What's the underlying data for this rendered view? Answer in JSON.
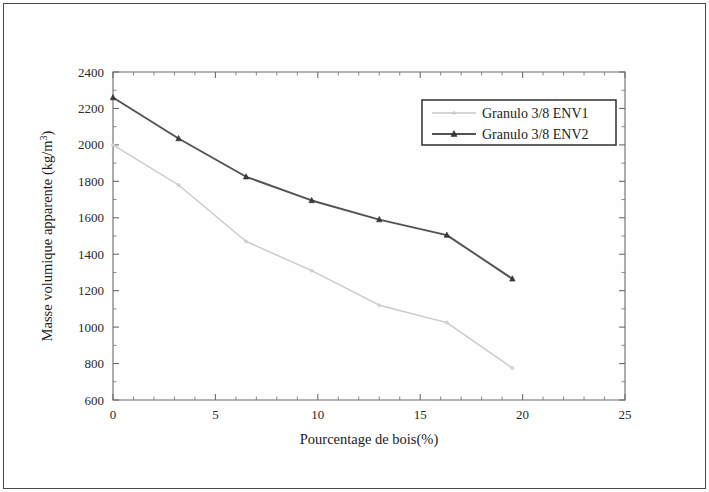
{
  "figure": {
    "background_color": "#fefefe",
    "border_color": "#4a4a4a"
  },
  "chart_data": {
    "type": "line",
    "title": "",
    "xlabel": "Pourcentage de bois(%)",
    "ylabel": "Masse volumique apparente (kg/m3)",
    "ylabel_display": "Masse volumique apparente (kg/m",
    "ylabel_superscript": "3",
    "ylabel_tail": ")",
    "xlim": [
      0,
      25
    ],
    "ylim": [
      600,
      2400
    ],
    "xticks": [
      0,
      5,
      10,
      15,
      20,
      25
    ],
    "yticks": [
      600,
      800,
      1000,
      1200,
      1400,
      1600,
      1800,
      2000,
      2200,
      2400
    ],
    "xtick_labels": [
      "0",
      "5",
      "10",
      "15",
      "20",
      "25"
    ],
    "ytick_labels": [
      "600",
      "800",
      "1000",
      "1200",
      "1400",
      "1600",
      "1800",
      "2000",
      "2200",
      "2400"
    ],
    "x_minor_interval": 1,
    "y_minor_interval": 100,
    "grid": false,
    "legend_position": "upper right",
    "x": [
      0,
      3.2,
      6.5,
      9.7,
      13.0,
      16.3,
      19.5
    ],
    "series": [
      {
        "name": "Granulo 3/8 ENV1",
        "color": "#c9c9c9",
        "marker": "none",
        "values": [
          2000,
          1780,
          1470,
          1310,
          1120,
          1025,
          775
        ]
      },
      {
        "name": "Granulo 3/8 ENV2",
        "color": "#525252",
        "marker": "triangle",
        "values": [
          2260,
          2035,
          1825,
          1695,
          1590,
          1505,
          1265
        ]
      }
    ]
  },
  "legend": {
    "entries": [
      {
        "label": "Granulo 3/8 ENV1"
      },
      {
        "label": "Granulo 3/8 ENV2"
      }
    ]
  }
}
